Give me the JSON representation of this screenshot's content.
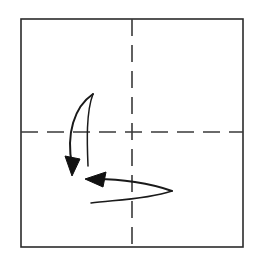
{
  "diagram": {
    "kind": "origami-fold-step",
    "title": "Origami fold step diagram",
    "canvas": {
      "width": 258,
      "height": 270,
      "background": "#ffffff"
    },
    "sheet": {
      "label": "paper-sheet",
      "x": 21,
      "y": 19,
      "width": 222,
      "height": 228,
      "stroke_color": "#2b2b2b",
      "stroke_width": 1.6,
      "fill_color": "#ffffff"
    },
    "creases": [
      {
        "label": "horizontal-crease",
        "orientation": "horizontal",
        "x1": 21,
        "y1": 132,
        "x2": 243,
        "y2": 132,
        "stroke_color": "#3a3a3a",
        "stroke_width": 1.6,
        "dash": "17 9"
      },
      {
        "label": "vertical-crease",
        "orientation": "vertical",
        "x1": 132,
        "y1": 19,
        "x2": 132,
        "y2": 247,
        "stroke_color": "#3a3a3a",
        "stroke_width": 1.6,
        "dash": "17 9"
      }
    ],
    "arrows": [
      {
        "label": "downward-fold-arrow",
        "direction": "down",
        "meaning": "fold top portion downward",
        "stroke_color": "#1a1a1a",
        "outer_path": "M 93 94 C 74 107, 66 134, 72 165",
        "inner_path": "M 93 94 C 86 112, 87 142, 88 166",
        "outer_width": 2.0,
        "inner_width": 1.5,
        "head": "72,176 65,156 80,159",
        "head_color": "#111111"
      },
      {
        "label": "leftward-fold-arrow",
        "direction": "left",
        "meaning": "fold right portion leftward",
        "stroke_color": "#1a1a1a",
        "outer_path": "M 172 191 C 150 183, 120 179, 97 179",
        "inner_path": "M 172 191 C 145 200, 112 200, 91 203",
        "outer_width": 2.0,
        "inner_width": 1.5,
        "head": "85,179 106,172 103,187",
        "head_color": "#111111"
      }
    ]
  }
}
